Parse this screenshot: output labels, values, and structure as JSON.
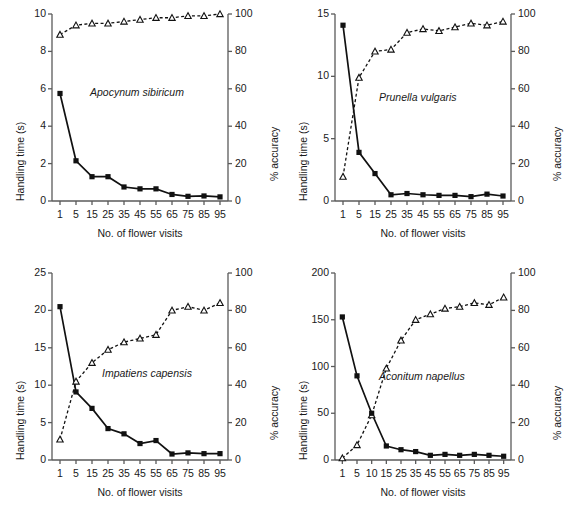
{
  "figure": {
    "panel_count": 4,
    "xlabel": "No. of flower visits",
    "ylabel_left": "Handling time (s)",
    "ylabel_right": "% accuracy",
    "series_names": [
      "Handling time",
      "% accuracy"
    ],
    "colors": {
      "line": "#111111",
      "marker_fill": "#111111",
      "marker_open": "#ffffff",
      "axis": "#555555",
      "text": "#1a1a1a"
    }
  },
  "chart_data": [
    {
      "type": "line",
      "title": "Apocynum sibiricum",
      "xlabel": "No. of flower visits",
      "ylabel": "Handling time (s)",
      "ylabel_right": "% accuracy",
      "x": [
        1,
        5,
        15,
        25,
        35,
        45,
        55,
        65,
        75,
        85,
        95
      ],
      "xtick_labels": [
        "1",
        "5",
        "15",
        "25",
        "35",
        "45",
        "55",
        "65",
        "75",
        "85",
        "95"
      ],
      "ylim": [
        0,
        10
      ],
      "yticks": [
        0,
        2,
        4,
        6,
        8,
        10
      ],
      "ylim_right": [
        0,
        100
      ],
      "yticks_right": [
        0,
        20,
        40,
        60,
        80,
        100
      ],
      "grid": false,
      "legend": "none",
      "series": [
        {
          "name": "Handling time",
          "axis": "left",
          "marker": "filled-square",
          "linestyle": "solid",
          "values": [
            5.75,
            2.15,
            1.3,
            1.3,
            0.75,
            0.65,
            0.65,
            0.35,
            0.25,
            0.27,
            0.22
          ]
        },
        {
          "name": "% accuracy",
          "axis": "right",
          "marker": "open-triangle",
          "linestyle": "dashed",
          "values": [
            89,
            94,
            95,
            95,
            96,
            97,
            98,
            98,
            99,
            99,
            100
          ]
        }
      ]
    },
    {
      "type": "line",
      "title": "Prunella vulgaris",
      "xlabel": "No. of flower visits",
      "ylabel": "Handling time (s)",
      "ylabel_right": "% accuracy",
      "x": [
        1,
        5,
        15,
        25,
        35,
        45,
        55,
        65,
        75,
        85,
        95
      ],
      "xtick_labels": [
        "1",
        "5",
        "15",
        "25",
        "35",
        "45",
        "55",
        "65",
        "75",
        "85",
        "95"
      ],
      "ylim": [
        0,
        15
      ],
      "yticks": [
        0,
        5,
        10,
        15
      ],
      "ylim_right": [
        0,
        100
      ],
      "yticks_right": [
        0,
        20,
        40,
        60,
        80,
        100
      ],
      "grid": false,
      "legend": "none",
      "series": [
        {
          "name": "Handling time",
          "axis": "left",
          "marker": "filled-square",
          "linestyle": "solid",
          "values": [
            14.1,
            3.9,
            2.2,
            0.5,
            0.6,
            0.5,
            0.45,
            0.45,
            0.35,
            0.55,
            0.4
          ]
        },
        {
          "name": "% accuracy",
          "axis": "right",
          "marker": "open-triangle",
          "linestyle": "dashed",
          "values": [
            13,
            66,
            80,
            81,
            90,
            92,
            91,
            93,
            95,
            94,
            96
          ]
        }
      ]
    },
    {
      "type": "line",
      "title": "Impatiens capensis",
      "xlabel": "No. of flower visits",
      "ylabel": "Handling time (s)",
      "ylabel_right": "% accuracy",
      "x": [
        1,
        5,
        15,
        25,
        35,
        45,
        55,
        65,
        75,
        85,
        95
      ],
      "xtick_labels": [
        "1",
        "5",
        "15",
        "25",
        "35",
        "45",
        "55",
        "65",
        "75",
        "85",
        "95"
      ],
      "ylim": [
        0,
        25
      ],
      "yticks": [
        0,
        5,
        10,
        15,
        20,
        25
      ],
      "ylim_right": [
        0,
        100
      ],
      "yticks_right": [
        0,
        20,
        40,
        60,
        80,
        100
      ],
      "grid": false,
      "legend": "none",
      "series": [
        {
          "name": "Handling time",
          "axis": "left",
          "marker": "filled-square",
          "linestyle": "solid",
          "values": [
            20.5,
            9.1,
            6.9,
            4.2,
            3.5,
            2.2,
            2.6,
            0.8,
            0.95,
            0.85,
            0.85
          ]
        },
        {
          "name": "% accuracy",
          "axis": "right",
          "marker": "open-triangle",
          "linestyle": "dashed",
          "values": [
            11,
            42,
            52,
            59,
            63,
            65,
            67,
            80,
            82,
            80,
            84
          ]
        }
      ]
    },
    {
      "type": "line",
      "title": "Aconitum napellus",
      "xlabel": "No. of flower visits",
      "ylabel": "Handling time (s)",
      "ylabel_right": "% accuracy",
      "x": [
        1,
        5,
        10,
        15,
        25,
        35,
        45,
        55,
        65,
        75,
        85,
        95
      ],
      "xtick_labels": [
        "1",
        "5",
        "10",
        "15",
        "25",
        "35",
        "45",
        "55",
        "65",
        "75",
        "85",
        "95"
      ],
      "ylim": [
        0,
        200
      ],
      "yticks": [
        0,
        50,
        100,
        150,
        200
      ],
      "ylim_right": [
        0,
        100
      ],
      "yticks_right": [
        0,
        20,
        40,
        60,
        80,
        100
      ],
      "grid": false,
      "legend": "none",
      "series": [
        {
          "name": "Handling time",
          "axis": "left",
          "marker": "filled-square",
          "linestyle": "solid",
          "values": [
            153,
            90,
            50,
            15,
            11,
            9,
            5,
            6,
            5,
            6,
            5,
            4
          ]
        },
        {
          "name": "% accuracy",
          "axis": "right",
          "marker": "open-triangle",
          "linestyle": "dashed",
          "values": [
            1,
            8,
            24,
            49,
            64,
            75,
            78,
            81,
            82,
            84,
            83,
            87
          ]
        }
      ]
    }
  ]
}
